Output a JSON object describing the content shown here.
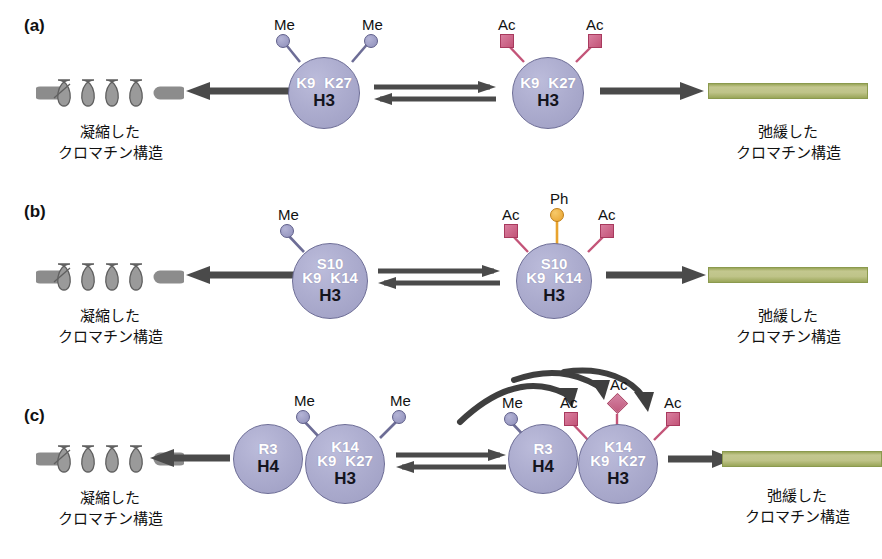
{
  "figure": {
    "condensed_caption_line1": "凝縮した",
    "condensed_caption_line2": "クロマチン構造",
    "relaxed_caption_line1": "弛緩した",
    "relaxed_caption_line2": "クロマチン構造",
    "colors": {
      "histone_fill": "#adadcf",
      "histone_stroke": "#6d6d96",
      "methyl": "#9d9dc4",
      "acetyl": "#c35478",
      "phospho": "#e8a32e",
      "arrow": "#4a4a4a",
      "condensed_chromatin": "#8c8c8c",
      "relaxed_chromatin": "#a9b36a"
    }
  },
  "panels": [
    {
      "label": "(a)",
      "left_chromatin": "condensed",
      "right_chromatin": "relaxed",
      "left_histones": [
        {
          "name": "H3",
          "residues": [
            "K9",
            "K27"
          ],
          "mods": [
            {
              "type": "Me",
              "label": "Me",
              "glyph": "circle"
            },
            {
              "type": "Me",
              "label": "Me",
              "glyph": "circle"
            }
          ]
        }
      ],
      "right_histones": [
        {
          "name": "H3",
          "residues": [
            "K9",
            "K27"
          ],
          "mods": [
            {
              "type": "Ac",
              "label": "Ac",
              "glyph": "square"
            },
            {
              "type": "Ac",
              "label": "Ac",
              "glyph": "square"
            }
          ]
        }
      ],
      "has_curved_arrows": false
    },
    {
      "label": "(b)",
      "left_chromatin": "condensed",
      "right_chromatin": "relaxed",
      "left_histones": [
        {
          "name": "H3",
          "residues_top": [
            "S10"
          ],
          "residues": [
            "K9",
            "K14"
          ],
          "mods": [
            {
              "type": "Me",
              "label": "Me",
              "glyph": "circle"
            }
          ]
        }
      ],
      "right_histones": [
        {
          "name": "H3",
          "residues_top": [
            "S10"
          ],
          "residues": [
            "K9",
            "K14"
          ],
          "mods": [
            {
              "type": "Ac",
              "label": "Ac",
              "glyph": "square"
            },
            {
              "type": "Ph",
              "label": "Ph",
              "glyph": "circle"
            },
            {
              "type": "Ac",
              "label": "Ac",
              "glyph": "square"
            }
          ]
        }
      ],
      "has_curved_arrows": false
    },
    {
      "label": "(c)",
      "left_chromatin": "condensed",
      "right_chromatin": "relaxed",
      "left_histones": [
        {
          "name": "H4",
          "residues": [
            "R3"
          ],
          "mods": []
        },
        {
          "name": "H3",
          "residues_top": [
            "K14"
          ],
          "residues": [
            "K9",
            "K27"
          ],
          "mods": [
            {
              "type": "Me",
              "label": "Me",
              "glyph": "circle"
            },
            {
              "type": "Me",
              "label": "Me",
              "glyph": "circle"
            }
          ]
        }
      ],
      "right_histones": [
        {
          "name": "H4",
          "residues": [
            "R3"
          ],
          "mods": [
            {
              "type": "Me",
              "label": "Me",
              "glyph": "circle"
            }
          ]
        },
        {
          "name": "H3",
          "residues_top": [
            "K14"
          ],
          "residues": [
            "K9",
            "K27"
          ],
          "mods": [
            {
              "type": "Ac",
              "label": "Ac",
              "glyph": "square"
            },
            {
              "type": "Ac",
              "label": "Ac",
              "glyph": "diamond"
            },
            {
              "type": "Ac",
              "label": "Ac",
              "glyph": "square"
            }
          ]
        }
      ],
      "has_curved_arrows": true,
      "curved_arrow_count": 3
    }
  ]
}
